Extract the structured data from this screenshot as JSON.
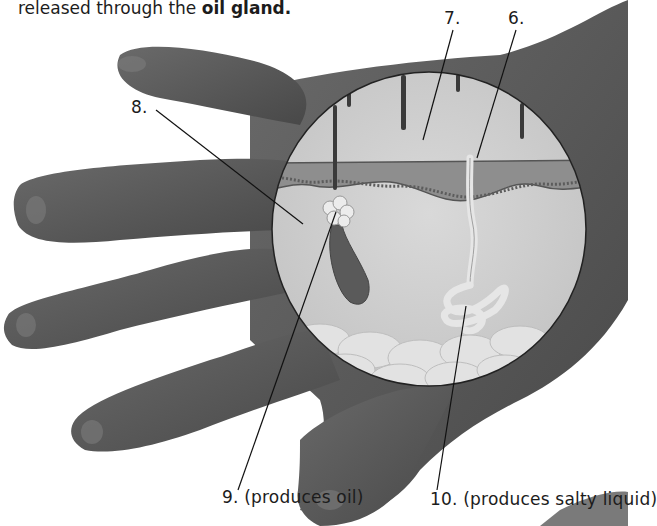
{
  "intro_text": {
    "prefix": "released through the ",
    "bold": "oil gland."
  },
  "labels": [
    {
      "id": "6",
      "number": "6.",
      "caption": ""
    },
    {
      "id": "7",
      "number": "7.",
      "caption": ""
    },
    {
      "id": "8",
      "number": "8.",
      "caption": ""
    },
    {
      "id": "9",
      "number": "9.",
      "caption": "(produces oil)"
    },
    {
      "id": "10",
      "number": "10.",
      "caption": "(produces salty liquid)"
    }
  ],
  "diagram": {
    "structures": [
      "hair shafts",
      "epidermis",
      "dermis",
      "oil gland",
      "hair follicle",
      "sweat pore",
      "sweat gland",
      "fat layer"
    ],
    "colors": {
      "hand": "#5a5a5a",
      "hand_dark": "#3e3e3e",
      "circle_bg": "#cfcfcf",
      "epidermis": "#8a8a8a",
      "leader_line": "#111111"
    }
  }
}
